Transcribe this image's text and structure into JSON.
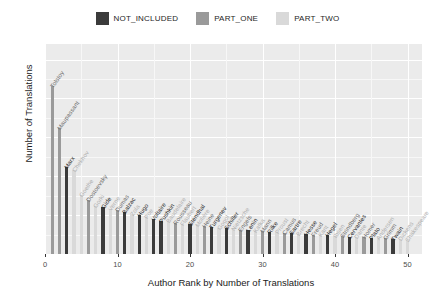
{
  "legend": {
    "position": "top",
    "items": [
      {
        "label": "NOT_INCLUDED",
        "color": "#3b3b3b"
      },
      {
        "label": "PART_ONE",
        "color": "#9a9a9a"
      },
      {
        "label": "PART_TWO",
        "color": "#d9d9d9"
      }
    ]
  },
  "axes": {
    "y_title": "Number of Translations",
    "x_title": "Author Rank by Number of Translations",
    "y_ticks": [
      "0",
      "500",
      "1000",
      "1500",
      "2000",
      "2500"
    ],
    "x_ticks": [
      "0",
      "10",
      "20",
      "30",
      "40",
      "50"
    ]
  },
  "chart_data": {
    "type": "bar",
    "title": "",
    "subtitle": "",
    "xlabel": "Author Rank by Number of Translations",
    "ylabel": "Number of Translations",
    "xlim": [
      0,
      52
    ],
    "ylim": [
      0,
      2700
    ],
    "grid": true,
    "legend_position": "top",
    "legend_entries": [
      "NOT_INCLUDED",
      "PART_ONE",
      "PART_TWO"
    ],
    "category_colors": {
      "NOT_INCLUDED": "#3b3b3b",
      "PART_ONE": "#9a9a9a",
      "PART_TWO": "#d9d9d9"
    },
    "categories": [
      1,
      2,
      3,
      4,
      5,
      6,
      7,
      8,
      9,
      10,
      11,
      12,
      13,
      14,
      15,
      16,
      17,
      18,
      19,
      20,
      21,
      22,
      23,
      24,
      25,
      26,
      27,
      28,
      29,
      30,
      31,
      32,
      33,
      34,
      35,
      36,
      37,
      38,
      39,
      40,
      41,
      42,
      43,
      44,
      45,
      46,
      47,
      48,
      49,
      50
    ],
    "values": [
      2160,
      1620,
      1120,
      1080,
      760,
      700,
      620,
      600,
      580,
      560,
      540,
      520,
      500,
      470,
      450,
      430,
      420,
      400,
      390,
      380,
      370,
      360,
      350,
      340,
      330,
      320,
      315,
      305,
      300,
      295,
      285,
      280,
      275,
      265,
      260,
      255,
      250,
      245,
      240,
      235,
      230,
      225,
      220,
      215,
      210,
      205,
      200,
      195,
      190,
      185
    ],
    "point_labels": [
      "Tolstoy",
      "Maupassant",
      "Marx",
      "Chekhov",
      "Goethe",
      "Dostoevsky",
      "Gorki",
      "Gide",
      "Verne",
      "Dumas",
      "Balzac",
      "Zola",
      "Hugo",
      "Poe",
      "Voltaire",
      "Pushkin",
      "Baudelaire",
      "Rousseau",
      "Flaubert",
      "Stendhal",
      "Molière",
      "Heine",
      "Turgenev",
      "Gogol",
      "Schiller",
      "Nietzsche",
      "Engels",
      "Lenin",
      "Kafka",
      "Mann",
      "Rilke",
      "Proust",
      "Camus",
      "Sartre",
      "Brecht",
      "Hesse",
      "Freud",
      "Kant",
      "Hegel",
      "Ibsen",
      "Strindberg",
      "Cervantes",
      "Dante",
      "Homer",
      "Plato",
      "Andersen",
      "Grimm",
      "Twain",
      "Dickens",
      "Shakespeare"
    ],
    "point_groups": [
      "PART_ONE",
      "PART_ONE",
      "NOT_INCLUDED",
      "PART_TWO",
      "PART_TWO",
      "PART_ONE",
      "PART_TWO",
      "NOT_INCLUDED",
      "PART_TWO",
      "PART_ONE",
      "NOT_INCLUDED",
      "PART_TWO",
      "NOT_INCLUDED",
      "PART_TWO",
      "NOT_INCLUDED",
      "NOT_INCLUDED",
      "PART_TWO",
      "PART_ONE",
      "PART_TWO",
      "NOT_INCLUDED",
      "PART_TWO",
      "PART_ONE",
      "NOT_INCLUDED",
      "PART_TWO",
      "NOT_INCLUDED",
      "PART_TWO",
      "PART_ONE",
      "NOT_INCLUDED",
      "PART_TWO",
      "PART_ONE",
      "NOT_INCLUDED",
      "PART_TWO",
      "PART_ONE",
      "NOT_INCLUDED",
      "PART_TWO",
      "NOT_INCLUDED",
      "PART_ONE",
      "PART_TWO",
      "NOT_INCLUDED",
      "PART_TWO",
      "PART_ONE",
      "NOT_INCLUDED",
      "PART_TWO",
      "PART_ONE",
      "NOT_INCLUDED",
      "PART_TWO",
      "PART_ONE",
      "NOT_INCLUDED",
      "PART_TWO",
      "PART_TWO"
    ]
  },
  "style": {
    "panel_bg": "#ebebeb",
    "grid_major": "#ffffff",
    "grid_minor": "#f7f7f7",
    "text": "#1a1a1a",
    "tick_text": "#4d4d4d"
  }
}
